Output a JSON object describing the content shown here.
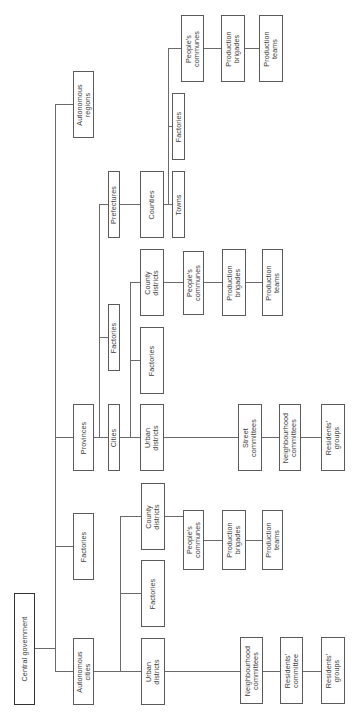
{
  "diagram": {
    "orientation": "rotated-90-ccw",
    "nodes": {
      "central_government": "Central government",
      "autonomous_cities": "Autonomous\ncities",
      "factories_central": "Factories",
      "provinces": "Provinces",
      "autonomous_regions": "Autonomous\nregions",
      "ac_urban_districts": "Urban\ndistricts",
      "ac_factories": "Factories",
      "ac_county_districts": "County\ndistricts",
      "ac_peoples_communes": "People's\ncommunes",
      "ac_production_brigades": "Production\nbrigades",
      "ac_production_teams": "Production\nteams",
      "ac_neighbourhood_committees": "Neighbourhood\ncommittees",
      "ac_residents_committee": "Residents'\ncommittee",
      "ac_residents_groups": "Residents'\ngroups",
      "cities": "Cities",
      "prov_factories": "Factories",
      "prefectures": "Prefectures",
      "city_urban_districts": "Urban\ndistricts",
      "city_factories": "Factories",
      "city_county_districts": "County\ndistricts",
      "counties": "Counties",
      "towns": "Towns",
      "county_factories": "Factories",
      "county_peoples_communes": "People's\ncommunes",
      "county_production_brigades": "Production\nbrigades",
      "county_production_teams": "Production\nteams",
      "cd_peoples_communes": "People's\ncommunes",
      "cd_production_brigades": "Production\nbrigades",
      "cd_production_teams": "Production\nteams",
      "street_committees": "Street\ncommittees",
      "city_neighbourhood_committees": "Neighbourhood\ncommittees",
      "city_residents_groups": "Residents'\ngroups"
    },
    "edges": [
      [
        "Central government",
        "Autonomous cities"
      ],
      [
        "Central government",
        "Factories"
      ],
      [
        "Central government",
        "Provinces"
      ],
      [
        "Central government",
        "Autonomous regions"
      ],
      [
        "Autonomous cities",
        "Urban districts"
      ],
      [
        "Autonomous cities",
        "Factories"
      ],
      [
        "Autonomous cities",
        "County districts"
      ],
      [
        "County districts",
        "People's communes"
      ],
      [
        "People's communes",
        "Production brigades"
      ],
      [
        "Production brigades",
        "Production teams"
      ],
      [
        "Urban districts",
        "Neighbourhood committees"
      ],
      [
        "Neighbourhood committees",
        "Residents' committee"
      ],
      [
        "Residents' committee",
        "Residents' groups"
      ],
      [
        "Provinces",
        "Cities"
      ],
      [
        "Provinces",
        "Factories"
      ],
      [
        "Provinces",
        "Prefectures"
      ],
      [
        "Cities",
        "Urban districts"
      ],
      [
        "Cities",
        "Factories"
      ],
      [
        "Cities",
        "County districts"
      ],
      [
        "Prefectures",
        "Counties"
      ],
      [
        "Counties",
        "Towns"
      ],
      [
        "Counties",
        "Factories"
      ],
      [
        "Counties",
        "People's communes"
      ],
      [
        "Urban districts",
        "Street committees"
      ],
      [
        "Street committees",
        "Neighbourhood committees"
      ],
      [
        "Neighbourhood committees",
        "Residents' groups"
      ]
    ]
  }
}
